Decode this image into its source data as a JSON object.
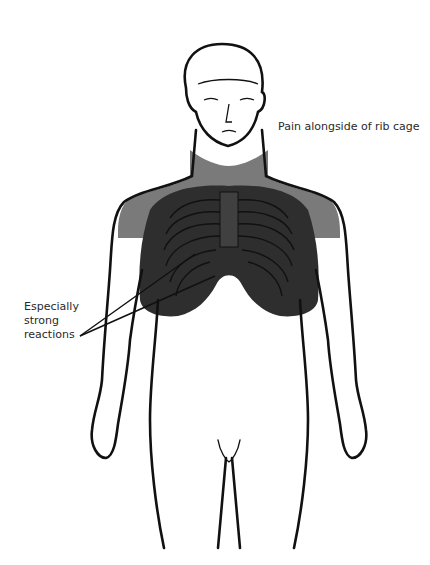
{
  "figure": {
    "colors": {
      "background": "#ffffff",
      "outline": "#111111",
      "light_zone": "#7a7a7a",
      "dark_zone": "#2e2e2e",
      "text": "#2a2a2a"
    },
    "zones": [
      {
        "name": "shoulders-neck-zone",
        "shade": "light"
      },
      {
        "name": "rib-cage-zone",
        "shade": "dark"
      }
    ]
  },
  "annotations": {
    "rib_cage": "Pain alongside of rib cage",
    "strong_reactions": {
      "lines": [
        "Especially",
        "strong",
        "reactions"
      ]
    }
  }
}
